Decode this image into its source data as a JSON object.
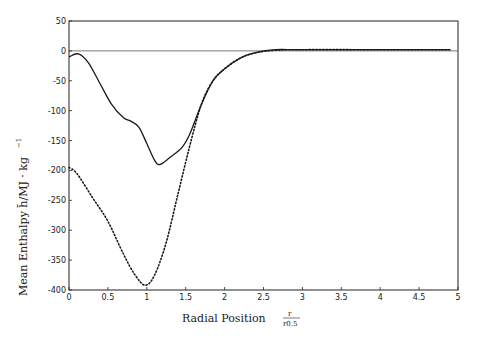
{
  "chart_data": {
    "type": "line",
    "title": "",
    "xlabel": "Radial Position",
    "xlabel_fraction": {
      "numerator": "r",
      "denominator": "r0.5"
    },
    "ylabel": "Mean Enthalpy h̄/MJ · kg",
    "ylabel_superscript": "−1",
    "xlim": [
      0,
      5
    ],
    "ylim": [
      -400,
      50
    ],
    "xticks": [
      0,
      0.5,
      1,
      1.5,
      2,
      2.5,
      3,
      3.5,
      4,
      4.5,
      5
    ],
    "xtick_labels": [
      "0",
      "0.5",
      "1",
      "1.5",
      "2",
      "2.5",
      "3",
      "3.5",
      "4",
      "4.5",
      "5"
    ],
    "yticks": [
      50,
      0,
      -50,
      -100,
      -150,
      -200,
      -250,
      -300,
      -350,
      -400
    ],
    "ytick_labels": [
      "50",
      "0",
      "-50",
      "-100",
      "-150",
      "-200",
      "-250",
      "-300",
      "-350",
      "-400"
    ],
    "grid": false,
    "reference_line": {
      "y": 0
    },
    "series": [
      {
        "name": "solid",
        "style": "solid",
        "color": "#1a1a1a",
        "x": [
          0,
          0.12,
          0.25,
          0.4,
          0.55,
          0.7,
          0.8,
          0.9,
          1.0,
          1.1,
          1.17,
          1.3,
          1.45,
          1.55,
          1.7,
          1.85,
          2.0,
          2.2,
          2.4,
          2.65,
          3.0,
          4.0,
          4.9
        ],
        "y": [
          -10,
          -5,
          -20,
          -55,
          -90,
          -112,
          -118,
          -128,
          -155,
          -183,
          -190,
          -178,
          -162,
          -140,
          -90,
          -50,
          -30,
          -12,
          -3,
          2,
          2,
          2,
          2
        ]
      },
      {
        "name": "dotted",
        "style": "dotted",
        "color": "#1a1a1a",
        "x": [
          0,
          0.1,
          0.3,
          0.5,
          0.7,
          0.85,
          0.98,
          1.1,
          1.25,
          1.4,
          1.55,
          1.7,
          1.85,
          2.0,
          2.2,
          2.4,
          2.65,
          3.0,
          4.0,
          4.9
        ],
        "y": [
          -195,
          -205,
          -245,
          -285,
          -340,
          -375,
          -392,
          -375,
          -320,
          -240,
          -160,
          -90,
          -50,
          -30,
          -12,
          -3,
          1,
          2,
          2,
          2
        ]
      }
    ]
  }
}
